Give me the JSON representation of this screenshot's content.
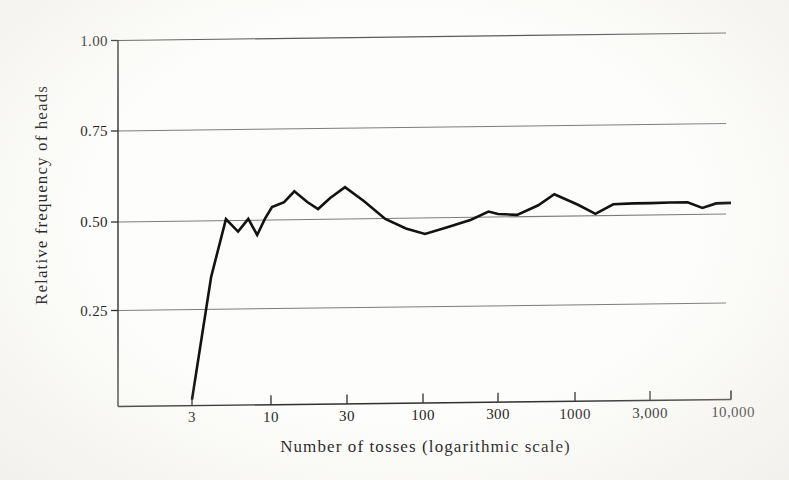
{
  "figure": {
    "background_color": "#fdfdfb",
    "ink_color": "#1a1a1a",
    "grid_color": "#8a8a8a",
    "curve_color": "#121212"
  },
  "chart_data": {
    "type": "line",
    "title": "",
    "subtitle": "",
    "xlabel": "Number of tosses (logarithmic scale)",
    "ylabel": "Relative frequency of heads",
    "xscale": "log",
    "yscale": "linear",
    "xlim": [
      2.4,
      11000
    ],
    "ylim": [
      0.0,
      1.04
    ],
    "grid": true,
    "grid_lines_y": [
      0.25,
      0.5,
      0.75,
      1.0
    ],
    "legend": "none",
    "xtick_labels": [
      "3",
      "10",
      "30",
      "100",
      "300",
      "1000",
      "3,000",
      "10,000"
    ],
    "xtick_values": [
      3,
      10,
      30,
      100,
      300,
      1000,
      3000,
      10000
    ],
    "ytick_labels": [
      "0.25",
      "0.50",
      "0.75",
      "1.00"
    ],
    "ytick_values": [
      0.25,
      0.5,
      0.75,
      1.0
    ],
    "series": [
      {
        "name": "Relative frequency of heads",
        "x": [
          3,
          4,
          5,
          6,
          7,
          8,
          9,
          10,
          12,
          14,
          17,
          20,
          24,
          30,
          40,
          55,
          75,
          100,
          140,
          200,
          260,
          300,
          400,
          550,
          700,
          1000,
          1300,
          1700,
          2300,
          3000,
          4000,
          5200,
          6500,
          8000,
          10000
        ],
        "y": [
          0.0,
          0.34,
          0.5,
          0.465,
          0.5,
          0.455,
          0.5,
          0.532,
          0.545,
          0.575,
          0.545,
          0.525,
          0.555,
          0.585,
          0.545,
          0.495,
          0.468,
          0.452,
          0.47,
          0.49,
          0.512,
          0.505,
          0.502,
          0.528,
          0.558,
          0.528,
          0.502,
          0.528,
          0.53,
          0.53,
          0.531,
          0.531,
          0.515,
          0.527,
          0.528
        ]
      }
    ],
    "annotations": []
  },
  "axes": {
    "y_title": "Relative frequency of heads",
    "x_title": "Number of tosses (logarithmic scale)",
    "y_ticks": [
      {
        "label": "1.00",
        "value": 1.0
      },
      {
        "label": "0.75",
        "value": 0.75
      },
      {
        "label": "0.50",
        "value": 0.5
      },
      {
        "label": "0.25",
        "value": 0.25
      }
    ],
    "x_ticks": [
      {
        "label": "3",
        "value": 3
      },
      {
        "label": "10",
        "value": 10
      },
      {
        "label": "30",
        "value": 30
      },
      {
        "label": "100",
        "value": 100
      },
      {
        "label": "300",
        "value": 300
      },
      {
        "label": "1000",
        "value": 1000
      },
      {
        "label": "3,000",
        "value": 3000
      },
      {
        "label": "10,000",
        "value": 10000
      }
    ]
  }
}
